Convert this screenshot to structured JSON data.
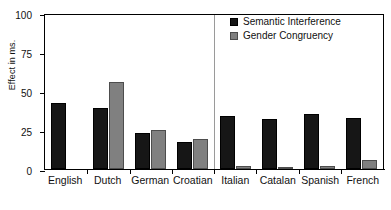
{
  "chart_data": {
    "type": "bar",
    "title": "",
    "xlabel": "",
    "ylabel": "Effect in ms.",
    "ylim": [
      0,
      100
    ],
    "yticks": [
      0,
      25,
      50,
      75,
      100
    ],
    "grid": false,
    "legend_position": "top-right",
    "categories": [
      "English",
      "Dutch",
      "German",
      "Croatian",
      "Italian",
      "Catalan",
      "Spanish",
      "French"
    ],
    "series": [
      {
        "name": "Semantic Interference",
        "color": "#161616",
        "values": [
          42,
          39,
          23,
          17,
          34,
          32,
          35,
          33
        ]
      },
      {
        "name": "Gender Congruency",
        "color": "#808080",
        "values": [
          null,
          56,
          25,
          19,
          2,
          1,
          2,
          6
        ]
      }
    ],
    "annotations": [
      {
        "type": "vertical-divider",
        "after_category": "Croatian",
        "color": "#9a9a9a"
      }
    ]
  },
  "axis": {
    "y_title": "Effect in ms.",
    "y_tick_labels": [
      "0",
      "25",
      "50",
      "75",
      "100"
    ]
  },
  "legend": {
    "items": [
      {
        "label": "Semantic Interference",
        "swatch": "dark-square-icon"
      },
      {
        "label": "Gender Congruency",
        "swatch": "gray-square-icon"
      }
    ]
  }
}
